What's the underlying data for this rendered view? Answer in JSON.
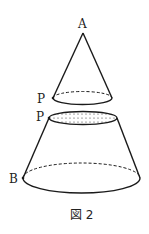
{
  "figure": {
    "caption": "図 2",
    "labels": {
      "apex": "A",
      "cone_base_point": "P",
      "frustum_top_point": "P",
      "frustum_bottom_point": "B"
    },
    "stroke_color": "#1a1a1a",
    "background": "#ffffff"
  }
}
